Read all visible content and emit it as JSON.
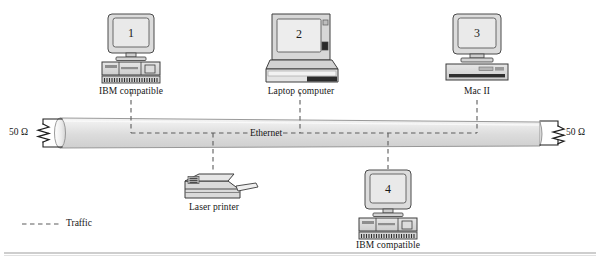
{
  "figure": {
    "title_label": "Ethernet",
    "bus": {
      "label": "Ethernet",
      "left_terminator": "50 Ω",
      "right_terminator": "50 Ω"
    },
    "legend": {
      "traffic_label": "Traffic",
      "line_style": "dashed"
    },
    "nodes": [
      {
        "id": "node-1",
        "number": "1",
        "label": "IBM compatible",
        "device": "desktop-computer",
        "position": "top-left"
      },
      {
        "id": "node-2",
        "number": "2",
        "label": "Laptop computer",
        "device": "laptop-computer",
        "position": "top-center"
      },
      {
        "id": "node-3",
        "number": "3",
        "label": "Mac II",
        "device": "mac-computer",
        "position": "top-right"
      },
      {
        "id": "node-4",
        "number": "4",
        "label": "IBM compatible",
        "device": "desktop-computer",
        "position": "bottom-center"
      },
      {
        "id": "node-printer",
        "number": "",
        "label": "Laser printer",
        "device": "laser-printer",
        "position": "bottom-left"
      }
    ],
    "colors": {
      "ink": "#161616",
      "device_fill": "#d9d9d9",
      "device_screen": "#e3e3e3",
      "cable_fill": "#e0e0e0",
      "cable_stroke": "#8a8a8a",
      "traffic_dash": "#666666",
      "rule": "#9a9a9a"
    }
  }
}
